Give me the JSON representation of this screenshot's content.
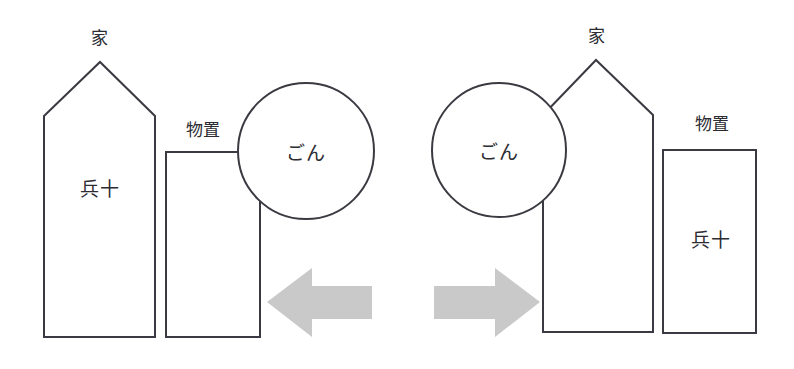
{
  "canvas": {
    "width": 794,
    "height": 369,
    "background": "#ffffff",
    "outline_color": "#3a3a42",
    "arrow_color": "#c9c9c9",
    "text_color": "#2c2c32"
  },
  "left_scene": {
    "house": {
      "caption": "家",
      "occupant": "兵十"
    },
    "shed": {
      "caption": "物置",
      "occupant": ""
    },
    "circle": {
      "occupant": "ごん"
    },
    "arrow": {
      "direction": "left"
    }
  },
  "right_scene": {
    "house": {
      "caption": "家",
      "occupant": ""
    },
    "shed": {
      "caption": "物置",
      "occupant": "兵十"
    },
    "circle": {
      "occupant": "ごん"
    },
    "arrow": {
      "direction": "right"
    }
  }
}
